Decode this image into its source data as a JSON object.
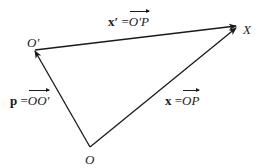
{
  "diagram": {
    "points": {
      "O": {
        "label": "O",
        "x": 90,
        "y": 147
      },
      "O_prime": {
        "label": "O′",
        "x": 34,
        "y": 50
      },
      "X": {
        "label": "X",
        "x": 237,
        "y": 27
      }
    },
    "vectors": [
      {
        "name": "p",
        "from": "O",
        "to": "O_prime",
        "lhs": "p",
        "eq": " =",
        "rhs": "OO′"
      },
      {
        "name": "x",
        "from": "O",
        "to": "X",
        "lhs": "x",
        "eq": " =",
        "rhs": "OP"
      },
      {
        "name": "x_prime",
        "from": "O_prime",
        "to": "X",
        "lhs": "x′",
        "eq": " =",
        "rhs": "O′P"
      }
    ],
    "stroke_color": "#1a1a1a"
  }
}
